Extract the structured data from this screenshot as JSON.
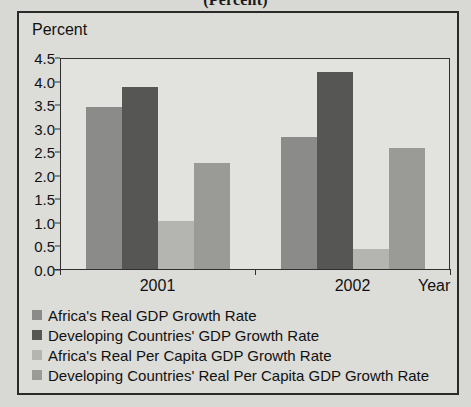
{
  "supertitle": "(Percent)",
  "axis": {
    "y_title": "Percent",
    "x_title": "Year"
  },
  "chart_data": {
    "type": "bar",
    "title": "(Percent)",
    "xlabel": "Year",
    "ylabel": "Percent",
    "ylim": [
      0.0,
      4.5
    ],
    "ytick_labels": [
      "0.0",
      "0.5",
      "1.0",
      "1.5",
      "2.0",
      "2.5",
      "3.0",
      "3.5",
      "4.0",
      "4.5"
    ],
    "ytick_values": [
      0.0,
      0.5,
      1.0,
      1.5,
      2.0,
      2.5,
      3.0,
      3.5,
      4.0,
      4.5
    ],
    "grid": false,
    "legend_position": "below",
    "categories": [
      "2001",
      "2002"
    ],
    "series": [
      {
        "name": "Africa's Real GDP Growth Rate",
        "color": "#8b8b89",
        "values": [
          3.45,
          2.82
        ]
      },
      {
        "name": "Developing Countries' GDP Growth Rate",
        "color": "#565654",
        "values": [
          3.88,
          4.2
        ]
      },
      {
        "name": "Africa's Real Per Capita GDP Growth Rate",
        "color": "#b4b4b1",
        "values": [
          1.03,
          0.45
        ]
      },
      {
        "name": "Developing Countries' Real Per Capita GDP Growth Rate",
        "color": "#9a9a97",
        "values": [
          2.28,
          2.6
        ]
      }
    ]
  }
}
